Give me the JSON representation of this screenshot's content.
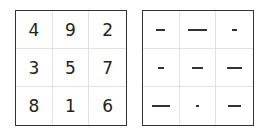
{
  "magic_square": {
    "cells": [
      "4",
      "9",
      "2",
      "3",
      "5",
      "7",
      "8",
      "1",
      "6"
    ]
  },
  "bar_square": {
    "bars": [
      4,
      9,
      2,
      3,
      5,
      7,
      8,
      1,
      6
    ],
    "unit_px": 2.2
  }
}
